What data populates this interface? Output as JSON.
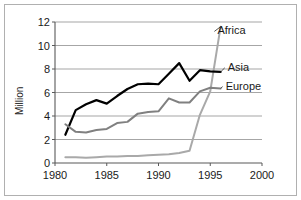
{
  "chart_data": {
    "type": "line",
    "title": "",
    "xlabel": "",
    "ylabel": "Million",
    "xlim": [
      1980,
      2000
    ],
    "ylim": [
      0,
      12
    ],
    "xticks": [
      1980,
      1985,
      1990,
      1995,
      2000
    ],
    "yticks": [
      0,
      2,
      4,
      6,
      8,
      10,
      12
    ],
    "grid": true,
    "legend_position": "inline-right-end-of-line",
    "series": [
      {
        "name": "Africa",
        "color": "#a9a9a9",
        "x": [
          1981,
          1982,
          1983,
          1984,
          1985,
          1986,
          1987,
          1988,
          1989,
          1990,
          1991,
          1992,
          1993,
          1994,
          1995,
          1996
        ],
        "values": [
          0.5,
          0.5,
          0.45,
          0.5,
          0.55,
          0.55,
          0.6,
          0.6,
          0.65,
          0.7,
          0.75,
          0.85,
          1.05,
          4.1,
          6.1,
          11.6
        ]
      },
      {
        "name": "Asia",
        "color": "#000000",
        "x": [
          1981,
          1982,
          1983,
          1984,
          1985,
          1986,
          1987,
          1988,
          1989,
          1990,
          1991,
          1992,
          1993,
          1994,
          1995,
          1996
        ],
        "values": [
          2.4,
          4.5,
          5.0,
          5.35,
          5.05,
          5.7,
          6.3,
          6.7,
          6.75,
          6.7,
          7.6,
          8.5,
          7.0,
          7.9,
          7.8,
          7.75
        ]
      },
      {
        "name": "Europe",
        "color": "#808080",
        "x": [
          1981,
          1982,
          1983,
          1984,
          1985,
          1986,
          1987,
          1988,
          1989,
          1990,
          1991,
          1992,
          1993,
          1994,
          1995,
          1996
        ],
        "values": [
          3.3,
          2.65,
          2.6,
          2.8,
          2.9,
          3.4,
          3.5,
          4.2,
          4.35,
          4.4,
          5.5,
          5.15,
          5.15,
          6.1,
          6.4,
          6.35
        ]
      }
    ],
    "series_labels": [
      {
        "name": "Africa",
        "x": 1995.4,
        "y": 11.2
      },
      {
        "name": "Asia",
        "x": 1996.4,
        "y": 8.1
      },
      {
        "name": "Europe",
        "x": 1996.2,
        "y": 6.5
      }
    ]
  }
}
